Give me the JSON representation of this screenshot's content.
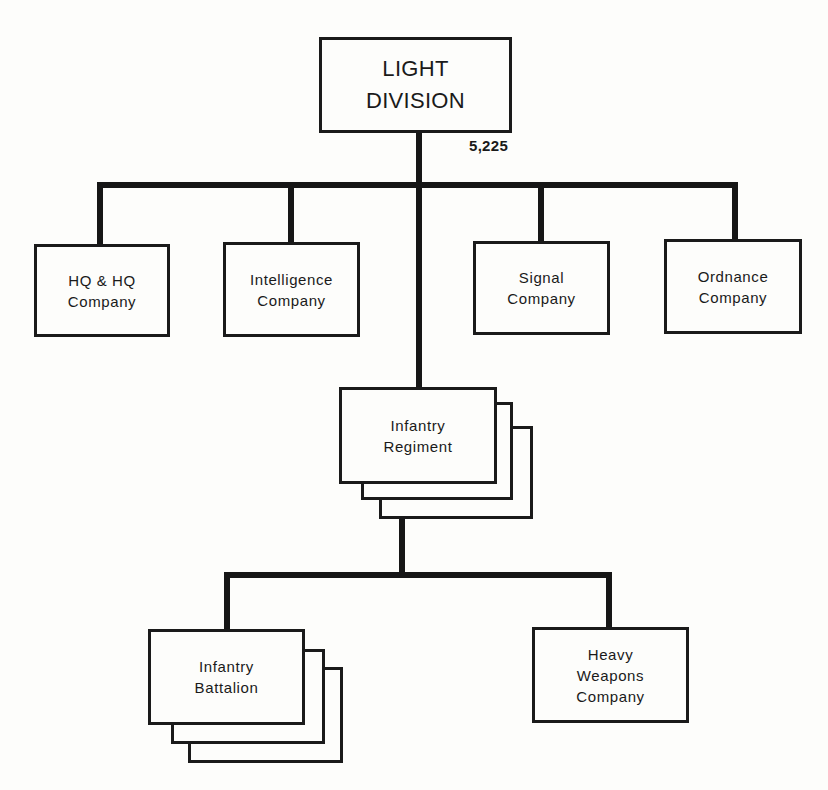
{
  "diagram": {
    "type": "org-chart",
    "root": {
      "label": "LIGHT\nDIVISION",
      "strength": "5,225"
    },
    "division_units": [
      {
        "id": "hq",
        "label": "HQ & HQ\nCompany",
        "multiple": false
      },
      {
        "id": "intelligence",
        "label": "Intelligence\nCompany",
        "multiple": false
      },
      {
        "id": "signal",
        "label": "Signal\nCompany",
        "multiple": false
      },
      {
        "id": "ordnance",
        "label": "Ordnance\nCompany",
        "multiple": false
      }
    ],
    "regiment": {
      "label": "Infantry\nRegiment",
      "multiple": true,
      "stack_count": 3
    },
    "regiment_units": [
      {
        "id": "battalion",
        "label": "Infantry\nBattalion",
        "multiple": true,
        "stack_count": 3
      },
      {
        "id": "heavy-weapons",
        "label": "Heavy\nWeapons\nCompany",
        "multiple": false
      }
    ],
    "colors": {
      "line": "#161616",
      "box_border": "#1a1a1a",
      "background": "#fdfdfb",
      "text": "#1a1a1a"
    }
  }
}
